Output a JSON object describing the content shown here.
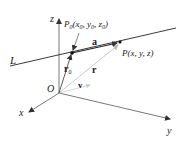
{
  "diagram": {
    "axes": {
      "x_label": "x",
      "y_label": "y",
      "z_label": "z",
      "origin_label": "O"
    },
    "line_label": "L",
    "points": {
      "p0": {
        "name": "P",
        "sub": "0",
        "coords_open": "(x",
        "coords_sub1": "0",
        "coords_mid1": ", y",
        "coords_sub2": "0",
        "coords_mid2": ", z",
        "coords_sub3": "0",
        "coords_close": ")"
      },
      "p": {
        "label": "P(x, y, z)"
      }
    },
    "vectors": {
      "a": "a",
      "r0": "r",
      "r0_sub": "0",
      "r": "r",
      "v": "v"
    },
    "colors": {
      "line": "#222222",
      "axis": "#555555",
      "vector_light": "#bbbbbb",
      "vector_v": "#cccccc"
    }
  }
}
